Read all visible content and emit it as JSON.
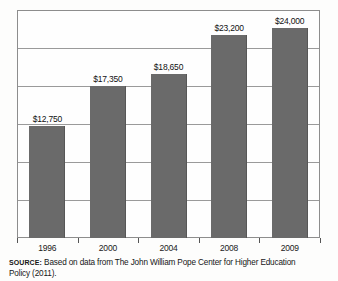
{
  "chart_data": {
    "type": "bar",
    "title": "",
    "xlabel": "",
    "ylabel": "",
    "categories": [
      "1996",
      "2000",
      "2004",
      "2008",
      "2009"
    ],
    "values": [
      12750,
      17350,
      18650,
      23200,
      24000
    ],
    "value_labels": [
      "$12,750",
      "$17,350",
      "$18,650",
      "$23,200",
      "$24,000"
    ],
    "ylim": [
      0,
      26000
    ],
    "grid": true,
    "gridline_count": 6,
    "legend": "none",
    "bar_color": "#6a6a6a",
    "frame_color": "#8d8d8d"
  },
  "caption": {
    "source_label": "SOURCE:",
    "line1": " Based on data from The John William Pope Center for Higher Education",
    "line2": "Policy (2011)."
  }
}
